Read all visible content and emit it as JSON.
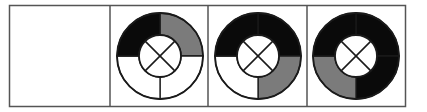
{
  "figure": {
    "colors": {
      "black": "#0a0a0a",
      "gray": "#7b7b7b",
      "white": "#ffffff",
      "line": "#1a1a1a",
      "frame": "#555555"
    },
    "cells": [
      {
        "index": 1,
        "empty": true
      },
      {
        "index": 2,
        "empty": false,
        "quadrants": {
          "top_left": "black",
          "top_right": "gray",
          "bottom_right": "white",
          "bottom_left": "white"
        },
        "bottom_divider": true
      },
      {
        "index": 3,
        "empty": false,
        "quadrants": {
          "top_left": "black",
          "top_right": "black",
          "bottom_right": "gray",
          "bottom_left": "white"
        },
        "bottom_divider": true
      },
      {
        "index": 4,
        "empty": false,
        "quadrants": {
          "top_left": "black",
          "top_right": "black",
          "bottom_right": "black",
          "bottom_left": "gray"
        },
        "bottom_divider": true
      }
    ]
  }
}
